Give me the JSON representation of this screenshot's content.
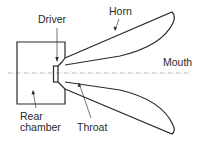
{
  "diagram": {
    "type": "horn loudspeaker cross-section",
    "labels": {
      "driver": "Driver",
      "horn": "Horn",
      "mouth": "Mouth",
      "rear_chamber_line1": "Rear",
      "rear_chamber_line2": "chamber",
      "throat": "Throat"
    },
    "colors": {
      "stroke": "#2a2a2a",
      "axis": "#9a9a9a",
      "background": "#ffffff"
    }
  }
}
